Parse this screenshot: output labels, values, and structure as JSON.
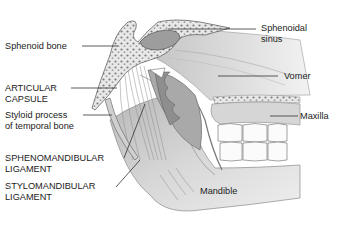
{
  "figure": {
    "type": "anatomical-illustration",
    "colors": {
      "background": "#ffffff",
      "bone_fill": "#e6e6e6",
      "bone_dark": "#8a8a8a",
      "tissue": "#c9c9c9",
      "shadow": "#7a7a7a",
      "leader_line": "#333333",
      "text": "#222222"
    }
  },
  "labels": {
    "sphenoid_bone": {
      "lines": [
        "Sphenoid bone"
      ]
    },
    "articular_capsule": {
      "lines": [
        "ARTICULAR",
        "CAPSULE"
      ]
    },
    "styloid_process": {
      "lines": [
        "Styloid process",
        "of temporal bone"
      ]
    },
    "sphenomandibular_ligament": {
      "lines": [
        "SPHENOMANDIBULAR",
        "LIGAMENT"
      ]
    },
    "stylomandibular_ligament": {
      "lines": [
        "STYLOMANDIBULAR",
        "LIGAMENT"
      ]
    },
    "sphenoidal_sinus": {
      "lines": [
        "Sphenoidal",
        "sinus"
      ]
    },
    "vomer": {
      "lines": [
        "Vomer"
      ]
    },
    "maxilla": {
      "lines": [
        "Maxilla"
      ]
    },
    "mandible": {
      "lines": [
        "Mandible"
      ]
    }
  }
}
